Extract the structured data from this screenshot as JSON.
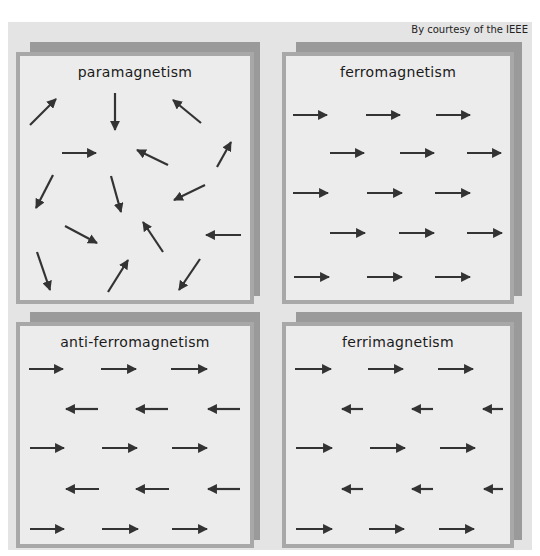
{
  "credit": "By courtesy of the IEEE",
  "colors": {
    "background": "#e4e4e4",
    "panel": "#ececec",
    "panel_border": "#a8a8a8",
    "shadow": "#9a9a9a",
    "arrow": "#333333"
  },
  "panels": [
    {
      "title": "paramagnetism",
      "arrows": [
        {
          "x1": 30,
          "y1": 125,
          "x2": 56,
          "y2": 99
        },
        {
          "x1": 115,
          "y1": 93,
          "x2": 115,
          "y2": 130
        },
        {
          "x1": 201,
          "y1": 123,
          "x2": 173,
          "y2": 100
        },
        {
          "x1": 62,
          "y1": 153,
          "x2": 96,
          "y2": 153
        },
        {
          "x1": 168,
          "y1": 165,
          "x2": 137,
          "y2": 150
        },
        {
          "x1": 217,
          "y1": 167,
          "x2": 231,
          "y2": 142
        },
        {
          "x1": 53,
          "y1": 175,
          "x2": 36,
          "y2": 208
        },
        {
          "x1": 111,
          "y1": 176,
          "x2": 121,
          "y2": 212
        },
        {
          "x1": 205,
          "y1": 185,
          "x2": 174,
          "y2": 200
        },
        {
          "x1": 65,
          "y1": 226,
          "x2": 97,
          "y2": 243
        },
        {
          "x1": 163,
          "y1": 252,
          "x2": 143,
          "y2": 222
        },
        {
          "x1": 241,
          "y1": 235,
          "x2": 206,
          "y2": 235
        },
        {
          "x1": 37,
          "y1": 252,
          "x2": 50,
          "y2": 290
        },
        {
          "x1": 108,
          "y1": 292,
          "x2": 128,
          "y2": 260
        },
        {
          "x1": 200,
          "y1": 259,
          "x2": 179,
          "y2": 290
        }
      ]
    },
    {
      "title": "ferromagnetism",
      "arrows": [
        {
          "x1": 293,
          "y1": 115,
          "x2": 327,
          "y2": 115
        },
        {
          "x1": 366,
          "y1": 115,
          "x2": 400,
          "y2": 115
        },
        {
          "x1": 436,
          "y1": 115,
          "x2": 470,
          "y2": 115
        },
        {
          "x1": 330,
          "y1": 153,
          "x2": 364,
          "y2": 153
        },
        {
          "x1": 400,
          "y1": 153,
          "x2": 434,
          "y2": 153
        },
        {
          "x1": 467,
          "y1": 153,
          "x2": 501,
          "y2": 153
        },
        {
          "x1": 293,
          "y1": 193,
          "x2": 328,
          "y2": 193
        },
        {
          "x1": 367,
          "y1": 193,
          "x2": 402,
          "y2": 193
        },
        {
          "x1": 435,
          "y1": 193,
          "x2": 470,
          "y2": 193
        },
        {
          "x1": 330,
          "y1": 233,
          "x2": 365,
          "y2": 233
        },
        {
          "x1": 399,
          "y1": 233,
          "x2": 434,
          "y2": 233
        },
        {
          "x1": 467,
          "y1": 233,
          "x2": 502,
          "y2": 233
        },
        {
          "x1": 294,
          "y1": 277,
          "x2": 329,
          "y2": 277
        },
        {
          "x1": 367,
          "y1": 277,
          "x2": 402,
          "y2": 277
        },
        {
          "x1": 435,
          "y1": 277,
          "x2": 470,
          "y2": 277
        }
      ]
    },
    {
      "title": "anti-ferromagnetism",
      "arrows": [
        {
          "x1": 29,
          "y1": 369,
          "x2": 63,
          "y2": 369
        },
        {
          "x1": 101,
          "y1": 369,
          "x2": 136,
          "y2": 369
        },
        {
          "x1": 171,
          "y1": 369,
          "x2": 207,
          "y2": 369
        },
        {
          "x1": 98,
          "y1": 409,
          "x2": 66,
          "y2": 409
        },
        {
          "x1": 168,
          "y1": 409,
          "x2": 136,
          "y2": 409
        },
        {
          "x1": 240,
          "y1": 409,
          "x2": 208,
          "y2": 409
        },
        {
          "x1": 30,
          "y1": 448,
          "x2": 64,
          "y2": 448
        },
        {
          "x1": 102,
          "y1": 448,
          "x2": 137,
          "y2": 448
        },
        {
          "x1": 172,
          "y1": 448,
          "x2": 207,
          "y2": 448
        },
        {
          "x1": 99,
          "y1": 489,
          "x2": 66,
          "y2": 489
        },
        {
          "x1": 169,
          "y1": 489,
          "x2": 136,
          "y2": 489
        },
        {
          "x1": 240,
          "y1": 489,
          "x2": 208,
          "y2": 489
        },
        {
          "x1": 30,
          "y1": 529,
          "x2": 64,
          "y2": 529
        },
        {
          "x1": 102,
          "y1": 529,
          "x2": 138,
          "y2": 529
        },
        {
          "x1": 172,
          "y1": 529,
          "x2": 207,
          "y2": 529
        }
      ]
    },
    {
      "title": "ferrimagnetism",
      "arrows": [
        {
          "x1": 295,
          "y1": 369,
          "x2": 331,
          "y2": 369
        },
        {
          "x1": 368,
          "y1": 369,
          "x2": 403,
          "y2": 369
        },
        {
          "x1": 438,
          "y1": 369,
          "x2": 473,
          "y2": 369
        },
        {
          "x1": 363,
          "y1": 409,
          "x2": 342,
          "y2": 409
        },
        {
          "x1": 433,
          "y1": 409,
          "x2": 412,
          "y2": 409
        },
        {
          "x1": 503,
          "y1": 409,
          "x2": 483,
          "y2": 409
        },
        {
          "x1": 296,
          "y1": 448,
          "x2": 332,
          "y2": 448
        },
        {
          "x1": 370,
          "y1": 448,
          "x2": 405,
          "y2": 448
        },
        {
          "x1": 440,
          "y1": 448,
          "x2": 475,
          "y2": 448
        },
        {
          "x1": 363,
          "y1": 489,
          "x2": 342,
          "y2": 489
        },
        {
          "x1": 433,
          "y1": 489,
          "x2": 412,
          "y2": 489
        },
        {
          "x1": 503,
          "y1": 489,
          "x2": 484,
          "y2": 489
        },
        {
          "x1": 296,
          "y1": 529,
          "x2": 332,
          "y2": 529
        },
        {
          "x1": 369,
          "y1": 529,
          "x2": 404,
          "y2": 529
        },
        {
          "x1": 439,
          "y1": 529,
          "x2": 474,
          "y2": 529
        }
      ]
    }
  ]
}
